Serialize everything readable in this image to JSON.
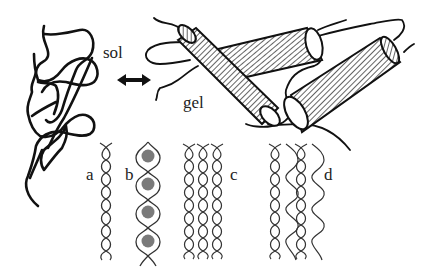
{
  "labels": {
    "sol": "sol",
    "gel": "gel",
    "a": "a",
    "b": "b",
    "c": "c",
    "d": "d"
  },
  "arrow": {
    "type": "double-headed",
    "meaning": "sol-gel transition"
  },
  "panels": [
    {
      "id": "a",
      "description": "single helix"
    },
    {
      "id": "b",
      "description": "helix with enclosed spheres",
      "sphere_count": 4
    },
    {
      "id": "c",
      "description": "three parallel helices in tight lattice"
    },
    {
      "id": "d",
      "description": "two interlinked helix pairs"
    }
  ],
  "colors": {
    "ink": "#111111",
    "helix": "#333333",
    "sphere": "#7a7a7a",
    "background": "#ffffff"
  }
}
